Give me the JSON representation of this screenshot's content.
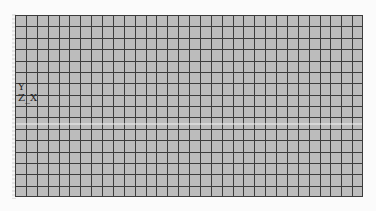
{
  "viewport": {
    "background": "#fbfbfb"
  },
  "mesh": {
    "columns": 32,
    "rows": 16,
    "fill_color": "#bcbcbc",
    "line_color": "#3c3c3c",
    "highlight_line_color": "#f2f2f2",
    "highlight_line_row_y": 109
  },
  "triad": {
    "y_label": "Y",
    "zx_label": "Z_X"
  }
}
